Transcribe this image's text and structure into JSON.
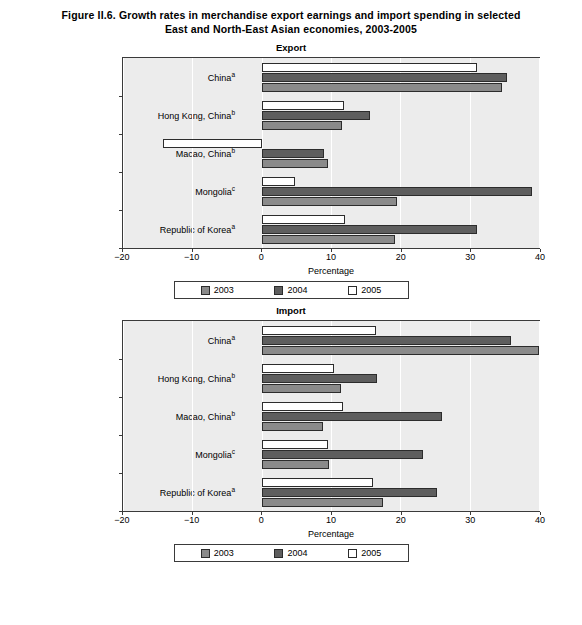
{
  "figure": {
    "title_line1": "Figure II.6. Growth rates in merchandise export earnings and import spending in selected",
    "title_line2": "East and North-East Asian economies, 2003-2005"
  },
  "legend": {
    "items": [
      {
        "label": "2003",
        "color": "#8a8a8a"
      },
      {
        "label": "2004",
        "color": "#5e5e5e"
      },
      {
        "label": "2005",
        "color": "#ffffff"
      }
    ]
  },
  "axis": {
    "xlabel": "Percentage",
    "ticks": [
      "-20",
      "-10",
      "0",
      "10",
      "20",
      "30",
      "40"
    ],
    "tick_values": [
      -20,
      -10,
      0,
      10,
      20,
      30,
      40
    ],
    "xlim": [
      -20,
      40
    ]
  },
  "categories": [
    {
      "name": "China",
      "note": "a"
    },
    {
      "name": "Hong Kong, China",
      "note": "b"
    },
    {
      "name": "Macao, China",
      "note": "b"
    },
    {
      "name": "Mongolia",
      "note": "c"
    },
    {
      "name": "Republic of Korea",
      "note": "a"
    }
  ],
  "footer": "",
  "chart_data": [
    {
      "type": "bar",
      "orientation": "horizontal",
      "title": "Export",
      "xlabel": "Percentage",
      "ylabel": "",
      "xlim": [
        -20,
        40
      ],
      "grid": true,
      "legend_position": "bottom",
      "categories": [
        "China",
        "Hong Kong, China",
        "Macao, China",
        "Mongolia",
        "Republic of Korea"
      ],
      "series": [
        {
          "name": "2003",
          "values": [
            34.6,
            11.6,
            9.5,
            19.5,
            19.2
          ]
        },
        {
          "name": "2004",
          "values": [
            35.4,
            15.6,
            9.0,
            39.0,
            31.0
          ]
        },
        {
          "name": "2005",
          "values": [
            31.0,
            11.9,
            -14.2,
            4.8,
            12.0
          ]
        }
      ]
    },
    {
      "type": "bar",
      "orientation": "horizontal",
      "title": "Import",
      "xlabel": "Percentage",
      "ylabel": "",
      "xlim": [
        -20,
        40
      ],
      "grid": true,
      "legend_position": "bottom",
      "categories": [
        "China",
        "Hong Kong, China",
        "Macao, China",
        "Mongolia",
        "Republic of Korea"
      ],
      "series": [
        {
          "name": "2003",
          "values": [
            40.0,
            11.5,
            8.8,
            9.7,
            17.5
          ]
        },
        {
          "name": "2004",
          "values": [
            36.0,
            16.7,
            26.0,
            23.2,
            25.3
          ]
        },
        {
          "name": "2005",
          "values": [
            16.5,
            10.4,
            11.7,
            9.6,
            16.0
          ]
        }
      ]
    }
  ]
}
